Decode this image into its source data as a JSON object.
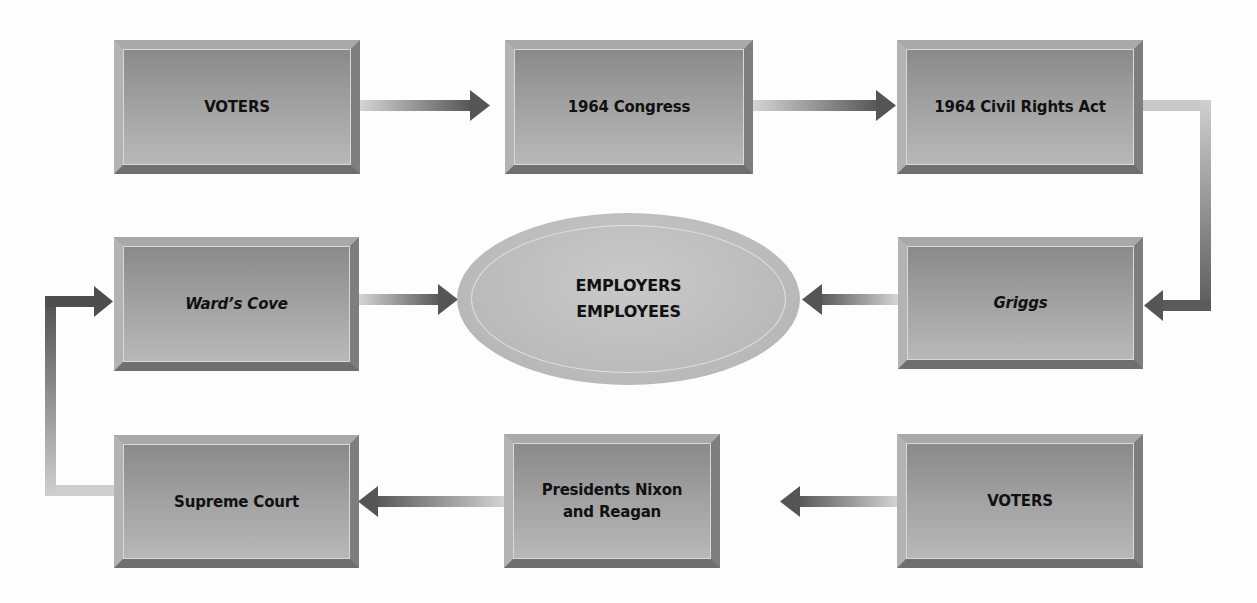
{
  "diagram": {
    "type": "cycle-flow",
    "nodes": [
      {
        "id": "voters_top",
        "label": "VOTERS",
        "italic": false,
        "row": 1,
        "col": 1
      },
      {
        "id": "congress",
        "label": "1964 Congress",
        "italic": false,
        "row": 1,
        "col": 2
      },
      {
        "id": "civil_rights_act",
        "label": "1964 Civil Rights Act",
        "italic": false,
        "row": 1,
        "col": 3
      },
      {
        "id": "wards_cove",
        "label": "Ward’s Cove",
        "italic": true,
        "row": 2,
        "col": 1
      },
      {
        "id": "griggs",
        "label": "Griggs",
        "italic": true,
        "row": 2,
        "col": 3
      },
      {
        "id": "supreme_court",
        "label": "Supreme Court",
        "italic": false,
        "row": 3,
        "col": 1
      },
      {
        "id": "presidents",
        "label_line1": "Presidents Nixon",
        "label_line2": "and Reagan",
        "italic": false,
        "row": 3,
        "col": 2
      },
      {
        "id": "voters_bottom",
        "label": "VOTERS",
        "italic": false,
        "row": 3,
        "col": 3
      }
    ],
    "center": {
      "id": "employers_employees",
      "line1": "EMPLOYERS",
      "line2": "EMPLOYEES"
    },
    "edges": [
      {
        "from": "voters_top",
        "to": "congress"
      },
      {
        "from": "congress",
        "to": "civil_rights_act"
      },
      {
        "from": "civil_rights_act",
        "to": "griggs"
      },
      {
        "from": "griggs",
        "to": "employers_employees"
      },
      {
        "from": "voters_bottom",
        "to": "presidents"
      },
      {
        "from": "presidents",
        "to": "supreme_court"
      },
      {
        "from": "supreme_court",
        "to": "wards_cove"
      },
      {
        "from": "wards_cove",
        "to": "employers_employees"
      }
    ],
    "colors": {
      "box_fill": "#a2a2a2",
      "box_bevel_light": "#b3b3b3",
      "box_bevel_dark": "#6f6f6f",
      "arrow_light": "#d0d0d0",
      "arrow_dark": "#555555",
      "ellipse_fill": "#bdbdbd",
      "text": "#111111"
    }
  }
}
